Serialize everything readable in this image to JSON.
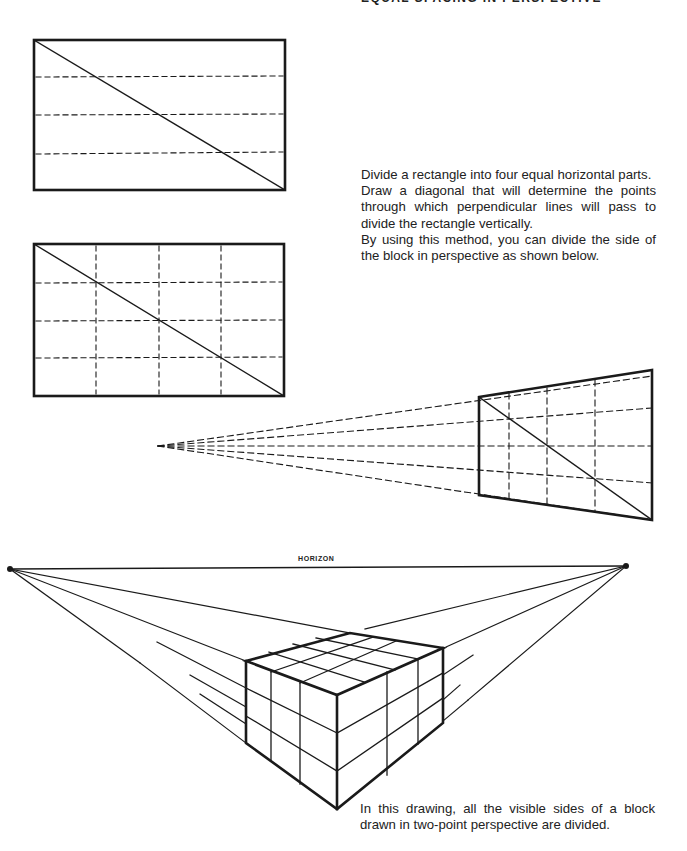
{
  "page": {
    "title": "EQUAL SPACING IN PERSPECTIVE"
  },
  "text": {
    "instructions_1": "Divide a rectangle into four equal horizontal parts.",
    "instructions_2": "Draw a diagonal that will determine the points through which perpendicular lines will pass to divide the rectangle vertically.",
    "instructions_3": "By using this method, you can divide the side of the block in perspective as shown below.",
    "caption": "In this drawing, all the visible sides of a block drawn in two-point perspective are divided.",
    "horizon_label": "HORIZON"
  },
  "figures": {
    "rectangle_horizontal_divisions": 4,
    "rectangle_vertical_divisions": 4,
    "perspective_panel_divisions": "4x4",
    "block_perspective": "two-point",
    "colors": {
      "ink": "#1a1a1a",
      "paper": "#ffffff"
    }
  }
}
